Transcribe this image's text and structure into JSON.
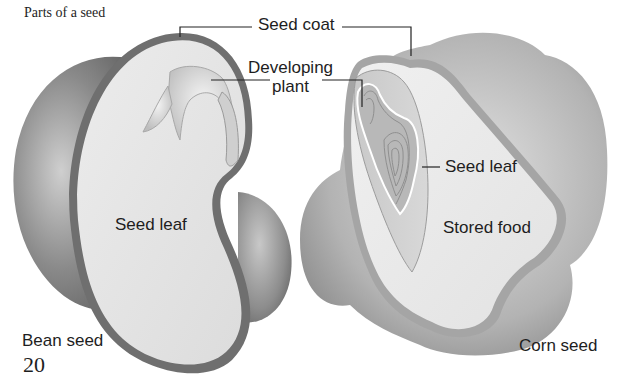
{
  "figure": {
    "title": "Parts of a seed",
    "page_number": "20"
  },
  "labels": {
    "seed_coat": "Seed coat",
    "developing_plant_line1": "Developing",
    "developing_plant_line2": "plant",
    "bean_seed_leaf": "Seed leaf",
    "corn_seed_leaf": "Seed leaf",
    "stored_food": "Stored food"
  },
  "seeds": [
    {
      "name": "Bean seed",
      "parts": [
        "Seed coat",
        "Developing plant",
        "Seed leaf"
      ]
    },
    {
      "name": "Corn seed",
      "parts": [
        "Seed coat",
        "Developing plant",
        "Seed leaf",
        "Stored food"
      ]
    }
  ],
  "colors": {
    "background": "#ffffff",
    "text": "#1e1e1e",
    "seed_coat_band": "#7a7a7a",
    "cut_surface": "#e6e6e6",
    "outer_shell": "#9c9c9c",
    "leader_line": "#222222"
  }
}
